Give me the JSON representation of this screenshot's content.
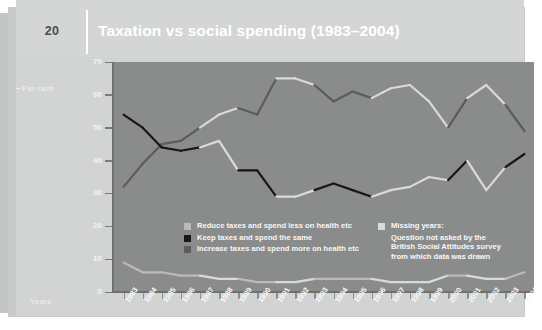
{
  "page_number": "20",
  "header": {
    "title": "Taxation vs social spending (1983–2004)"
  },
  "axis": {
    "ylabel": "Per cent",
    "xlabel": "Years"
  },
  "colors": {
    "panel": "#d2d3d3",
    "plot_background": "#8a8b8b",
    "series_reduce": "#b9bab9",
    "series_keep": "#171717",
    "series_increase": "#5b5c5c",
    "missing_marker": "#d9dada",
    "title_text": "#ffffff",
    "axis_line": "#6f7070"
  },
  "legend": {
    "series": [
      {
        "label": "Reduce taxes and spend less on health etc",
        "color": "#b9bab9"
      },
      {
        "label": "Keep taxes and spend the same",
        "color": "#171717"
      },
      {
        "label": "Increase taxes and spend more on health etc",
        "color": "#5b5c5c"
      }
    ],
    "note": {
      "color": "#d9dada",
      "lines": [
        "Missing years:",
        "Question not asked by the",
        "British Social Attitudes survey",
        "from which data was drawn"
      ]
    }
  },
  "chart_data": {
    "type": "line",
    "title": "Taxation vs social spending (1983–2004)",
    "xlabel": "Years",
    "ylabel": "Per cent",
    "ylim": [
      0,
      70
    ],
    "yticks": [
      0,
      10,
      20,
      30,
      40,
      50,
      60,
      70
    ],
    "grid": false,
    "legend_position": "inside-bottom",
    "categories": [
      "1983",
      "1984",
      "1985",
      "1986",
      "1987",
      "1988",
      "1989",
      "1990",
      "1991",
      "1992",
      "1993",
      "1994",
      "1995",
      "1996",
      "1997",
      "1998",
      "1999",
      "2000",
      "2001",
      "2002",
      "2003",
      "2004"
    ],
    "missing_years": [
      "1988",
      "1992",
      "1997",
      "1999",
      "2002"
    ],
    "series": [
      {
        "name": "Increase taxes and spend more on health etc",
        "color": "#5b5c5c",
        "values": [
          32,
          39,
          45,
          46,
          50,
          54,
          56,
          54,
          65,
          65,
          63,
          58,
          61,
          59,
          62,
          63,
          58,
          50,
          59,
          63,
          57,
          49
        ]
      },
      {
        "name": "Keep taxes and spend the same",
        "color": "#171717",
        "values": [
          54,
          50,
          44,
          43,
          44,
          46,
          37,
          37,
          29,
          29,
          31,
          33,
          31,
          29,
          31,
          32,
          35,
          34,
          40,
          31,
          38,
          42
        ]
      },
      {
        "name": "Reduce taxes and spend less on health etc",
        "color": "#b9bab9",
        "values": [
          9,
          6,
          6,
          5,
          5,
          4,
          4,
          3,
          3,
          3,
          4,
          4,
          4,
          4,
          3,
          3,
          3,
          5,
          5,
          4,
          4,
          6
        ]
      }
    ]
  }
}
